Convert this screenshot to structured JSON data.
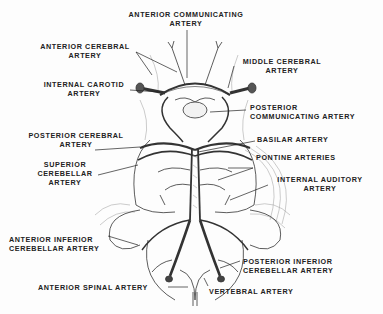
{
  "diagram": {
    "labels": {
      "anterior_communicating": [
        "ANTERIOR COMMUNICATING",
        "ARTERY"
      ],
      "anterior_cerebral": [
        "ANTERIOR CEREBRAL",
        "ARTERY"
      ],
      "middle_cerebral": [
        "MIDDLE CEREBRAL",
        "ARTERY"
      ],
      "internal_carotid": [
        "INTERNAL CAROTID",
        "ARTERY"
      ],
      "posterior_communicating": [
        "POSTERIOR",
        "COMMUNICATING ARTERY"
      ],
      "posterior_cerebral": [
        "POSTERIOR CEREBRAL",
        "ARTERY"
      ],
      "basilar": [
        "BASILAR ARTERY"
      ],
      "superior_cerebellar": [
        "SUPERIOR",
        "CEREBELLAR",
        "ARTERY"
      ],
      "pontine": [
        "PONTINE ARTERIES"
      ],
      "internal_auditory": [
        "INTERNAL AUDITORY",
        "ARTERY"
      ],
      "anterior_inferior_cerebellar": [
        "ANTERIOR INFERIOR",
        "CEREBELLAR ARTERY"
      ],
      "posterior_inferior_cerebellar": [
        "POSTERIOR INFERIOR",
        "CEREBELLAR ARTERY"
      ],
      "anterior_spinal": [
        "ANTERIOR SPINAL ARTERY"
      ],
      "vertebral": [
        "VERTEBRAL ARTERY"
      ]
    }
  }
}
